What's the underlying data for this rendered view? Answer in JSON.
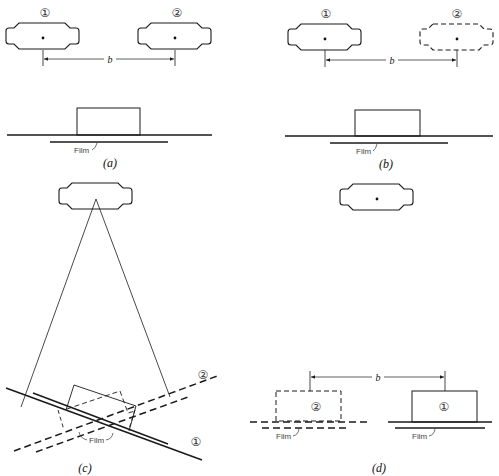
{
  "figure": {
    "panels": [
      {
        "id": "a",
        "caption": "(a)",
        "tube_labels": [
          "①",
          "②"
        ],
        "dimension_label": "b",
        "film_label": "Film",
        "tube2_style": "solid"
      },
      {
        "id": "b",
        "caption": "(b)",
        "tube_labels": [
          "①",
          "②"
        ],
        "dimension_label": "b",
        "film_label": "Film",
        "tube2_style": "dashed"
      },
      {
        "id": "c",
        "caption": "(c)",
        "film_label": "Film",
        "position_labels": [
          "②",
          "①"
        ]
      },
      {
        "id": "d",
        "caption": "(d)",
        "dimension_label": "b",
        "object_labels": [
          "②",
          "①"
        ],
        "film_labels": [
          "Film",
          "Film"
        ]
      }
    ],
    "colors": {
      "line": "#1a1a1a",
      "background": "#ffffff"
    }
  }
}
